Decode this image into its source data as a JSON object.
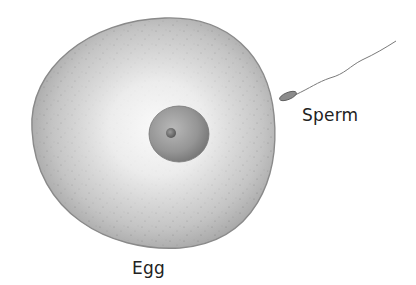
{
  "diagram": {
    "labels": {
      "sperm": "Sperm",
      "egg": "Egg"
    },
    "parts": [
      "egg-cell",
      "nucleus",
      "nucleolus",
      "sperm-head",
      "sperm-tail"
    ],
    "colors": {
      "background": "#ffffff",
      "egg_light": "#f4f4f4",
      "egg_dark": "#9a9a9a",
      "egg_outline": "#777777",
      "nucleus": "#8a8a8a",
      "text": "#222222"
    }
  }
}
